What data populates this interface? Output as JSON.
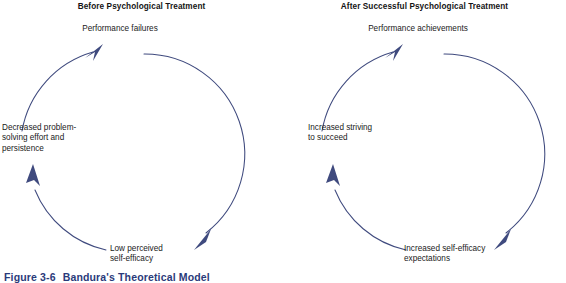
{
  "figure": {
    "caption_number": "Figure 3-6",
    "caption_title": "Bandura's Theoretical Model",
    "caption_color": "#2a3a7a",
    "arrow_color": "#3f4a7e",
    "text_color": "#1a1a1a",
    "background": "#ffffff"
  },
  "panels": [
    {
      "id": "before",
      "title": "Before Psychological Treatment",
      "nodes": [
        {
          "id": "top",
          "label": "Performance failures"
        },
        {
          "id": "left",
          "label": "Decreased problem-\nsolving effort and\npersistence"
        },
        {
          "id": "bottom",
          "label": "Low perceived\nself-efficacy"
        }
      ],
      "flow": "clockwise-cycle"
    },
    {
      "id": "after",
      "title": "After Successful Psychological Treatment",
      "nodes": [
        {
          "id": "top",
          "label": "Performance achievements"
        },
        {
          "id": "left",
          "label": "Increased striving\nto succeed"
        },
        {
          "id": "bottom",
          "label": "Increased self-efficacy\nexpectations"
        }
      ],
      "flow": "clockwise-cycle"
    }
  ]
}
